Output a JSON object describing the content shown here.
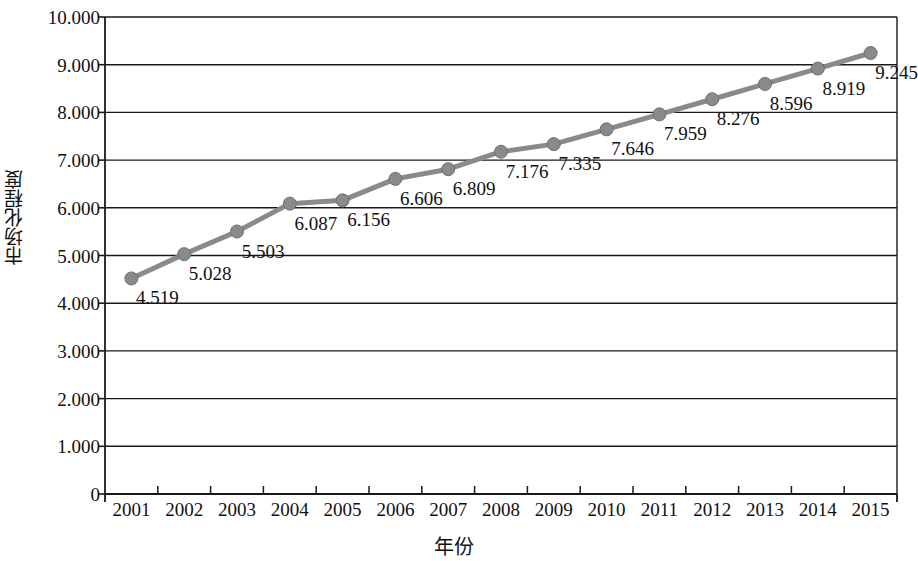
{
  "chart_data": {
    "type": "line",
    "title": "",
    "xlabel": "年份",
    "ylabel": "市场化程度",
    "categories": [
      "2001",
      "2002",
      "2003",
      "2004",
      "2005",
      "2006",
      "2007",
      "2008",
      "2009",
      "2010",
      "2011",
      "2012",
      "2013",
      "2014",
      "2015"
    ],
    "values": [
      4.519,
      5.028,
      5.503,
      6.087,
      6.156,
      6.606,
      6.809,
      7.176,
      7.335,
      7.646,
      7.959,
      8.276,
      8.596,
      8.919,
      9.245
    ],
    "data_labels": [
      "4.519",
      "5.028",
      "5.503",
      "6.087",
      "6.156",
      "6.606",
      "6.809",
      "7.176",
      "7.335",
      "7.646",
      "7.959",
      "8.276",
      "8.596",
      "8.919",
      "9.245"
    ],
    "ylim": [
      0,
      10
    ],
    "ytick_labels": [
      "10.000",
      "9.000",
      "8.000",
      "7.000",
      "6.000",
      "5.000",
      "4.000",
      "3.000",
      "2.000",
      "1.000",
      "0"
    ],
    "ytick_values": [
      10,
      9,
      8,
      7,
      6,
      5,
      4,
      3,
      2,
      1,
      0
    ],
    "grid": "horizontal",
    "legend": "none",
    "series_color": "#8a8a8a",
    "axis_color": "#1a1a1a",
    "marker": "circle"
  }
}
